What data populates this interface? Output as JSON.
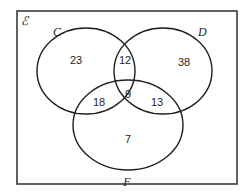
{
  "diagram": {
    "type": "venn",
    "universal_set_label": "ℰ",
    "sets": [
      {
        "name": "C",
        "label": "C"
      },
      {
        "name": "D",
        "label": "D"
      },
      {
        "name": "F",
        "label": "F"
      }
    ],
    "regions": {
      "C_only": "23",
      "C_and_D_only": "12",
      "D_only": "38",
      "C_and_F_only": "18",
      "C_and_D_and_F": "9",
      "D_and_F_only": "13",
      "F_only": "7"
    },
    "colors": {
      "stroke": "#1e1e1e",
      "background": "#ffffff"
    }
  }
}
